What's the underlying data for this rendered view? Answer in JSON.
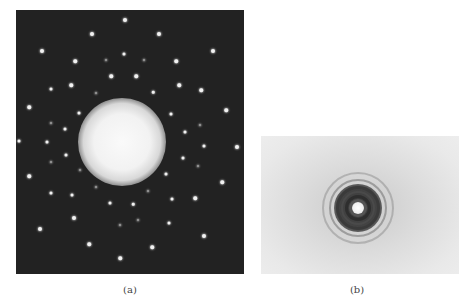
{
  "figure": {
    "panel_a": {
      "label": "(a)",
      "description": "Diffraction pattern with discrete bright spots on dark background and central bright glow",
      "background": "#222222",
      "glow": {
        "cx": 106,
        "cy": 132,
        "r": 44
      },
      "spots": [
        [
          109,
          10,
          4
        ],
        [
          76,
          24,
          4
        ],
        [
          26,
          41,
          4
        ],
        [
          59,
          51,
          3.5
        ],
        [
          108,
          44,
          3
        ],
        [
          90,
          50,
          2
        ],
        [
          95,
          66,
          3.5
        ],
        [
          55,
          75,
          3.5
        ],
        [
          35,
          79,
          3
        ],
        [
          80,
          83,
          2
        ],
        [
          143,
          24,
          4
        ],
        [
          197,
          41,
          4
        ],
        [
          128,
          50,
          2
        ],
        [
          160,
          51,
          3.5
        ],
        [
          120,
          66,
          3.5
        ],
        [
          163,
          75,
          3.5
        ],
        [
          185,
          80,
          3.5
        ],
        [
          137,
          82,
          2.5
        ],
        [
          13,
          97,
          3.5
        ],
        [
          63,
          103,
          3
        ],
        [
          35,
          113,
          2
        ],
        [
          49,
          119,
          3
        ],
        [
          3,
          131,
          3
        ],
        [
          31,
          132,
          3
        ],
        [
          50,
          145,
          3
        ],
        [
          35,
          152,
          2
        ],
        [
          64,
          160,
          2
        ],
        [
          13,
          166,
          3.5
        ],
        [
          155,
          104,
          3
        ],
        [
          210,
          100,
          3.5
        ],
        [
          184,
          115,
          2
        ],
        [
          169,
          122,
          3
        ],
        [
          188,
          136,
          3
        ],
        [
          221,
          137,
          4
        ],
        [
          167,
          148,
          3
        ],
        [
          182,
          156,
          2
        ],
        [
          150,
          164,
          3
        ],
        [
          206,
          172,
          3.5
        ],
        [
          35,
          183,
          3
        ],
        [
          56,
          185,
          3
        ],
        [
          80,
          177,
          2
        ],
        [
          94,
          193,
          3
        ],
        [
          58,
          208,
          4
        ],
        [
          24,
          219,
          4
        ],
        [
          104,
          215,
          2
        ],
        [
          73,
          234,
          3.5
        ],
        [
          104,
          248,
          3.5
        ],
        [
          132,
          181,
          2
        ],
        [
          156,
          189,
          3
        ],
        [
          179,
          188,
          3.5
        ],
        [
          117,
          194,
          2.5
        ],
        [
          153,
          213,
          3
        ],
        [
          122,
          210,
          2
        ],
        [
          188,
          226,
          4
        ],
        [
          136,
          237,
          3.5
        ]
      ]
    },
    "panel_b": {
      "label": "(b)",
      "description": "Ring diffraction pattern with concentric rings on light gray background",
      "center": {
        "cx": 97,
        "cy": 72
      },
      "rings": [
        {
          "r": 36,
          "w": 2,
          "color": "rgba(110,110,110,0.35)"
        },
        {
          "r": 29,
          "w": 2,
          "color": "rgba(90,90,90,0.45)"
        },
        {
          "r": 22,
          "w": 3,
          "color": "#3a3a3a"
        },
        {
          "r": 17,
          "w": 2,
          "color": "#4a4a4a"
        },
        {
          "r": 13,
          "w": 3,
          "color": "#2e2e2e"
        },
        {
          "r": 9,
          "w": 3,
          "color": "#555555"
        }
      ],
      "center_spot_r": 6
    }
  }
}
